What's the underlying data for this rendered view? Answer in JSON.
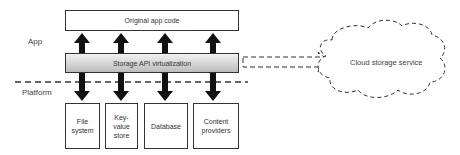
{
  "layers": {
    "app_label": "App",
    "platform_label": "Platform"
  },
  "top_box": {
    "label": "Original app code"
  },
  "virtualization_bar": {
    "label": "Storage API virtualization"
  },
  "storage_boxes": [
    {
      "label": "File system"
    },
    {
      "label": "Key-value store"
    },
    {
      "label": "Database"
    },
    {
      "label": "Content providers"
    }
  ],
  "cloud": {
    "label": "Cloud storage service"
  },
  "colors": {
    "stroke": "#333333",
    "arrow": "#111111",
    "bar_top": "#f2f2f2",
    "bar_bottom": "#bcbcbc"
  }
}
